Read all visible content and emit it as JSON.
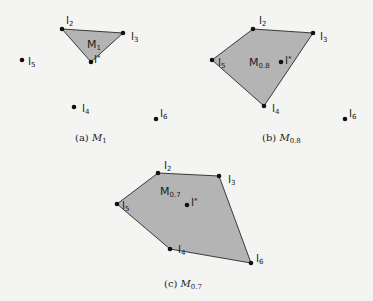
{
  "panels": [
    {
      "id": "a",
      "caption_prefix": "(a)",
      "caption_symbol": "M",
      "caption_sub": "1",
      "region_label": "M",
      "region_sub": "1",
      "polygon": [
        [
          62,
          29
        ],
        [
          123,
          33
        ],
        [
          91,
          62
        ]
      ],
      "points": [
        {
          "name": "l",
          "sub": "2",
          "x": 62,
          "y": 29,
          "lx": 66,
          "ly": 24
        },
        {
          "name": "l",
          "sub": "3",
          "x": 123,
          "y": 33,
          "lx": 131,
          "ly": 40
        },
        {
          "name": "l",
          "sub": "*",
          "x": 91,
          "y": 62,
          "lx": 94,
          "ly": 63
        },
        {
          "name": "l",
          "sub": "5",
          "x": 22,
          "y": 60,
          "lx": 28,
          "ly": 65
        },
        {
          "name": "l",
          "sub": "4",
          "x": 74,
          "y": 107,
          "lx": 82,
          "ly": 112
        },
        {
          "name": "l",
          "sub": "6",
          "x": 156,
          "y": 119,
          "lx": 160,
          "ly": 117
        }
      ],
      "region_pos": [
        87,
        48
      ],
      "caption_pos": [
        75,
        141
      ]
    },
    {
      "id": "b",
      "caption_prefix": "(b)",
      "caption_symbol": "M",
      "caption_sub": "0.8",
      "region_label": "M",
      "region_sub": "0.8",
      "polygon": [
        [
          253,
          29
        ],
        [
          313,
          33
        ],
        [
          264,
          106
        ],
        [
          212,
          60
        ]
      ],
      "points": [
        {
          "name": "l",
          "sub": "2",
          "x": 253,
          "y": 29,
          "lx": 259,
          "ly": 24
        },
        {
          "name": "l",
          "sub": "3",
          "x": 313,
          "y": 33,
          "lx": 320,
          "ly": 40
        },
        {
          "name": "l",
          "sub": "5",
          "x": 212,
          "y": 60,
          "lx": 218,
          "ly": 66
        },
        {
          "name": "l",
          "sub": "4",
          "x": 264,
          "y": 106,
          "lx": 272,
          "ly": 112
        },
        {
          "name": "l",
          "sub": "*",
          "x": 281,
          "y": 62,
          "lx": 285,
          "ly": 64
        },
        {
          "name": "l",
          "sub": "6",
          "x": 345,
          "y": 119,
          "lx": 349,
          "ly": 117
        }
      ],
      "region_pos": [
        249,
        66
      ],
      "caption_pos": [
        262,
        141
      ]
    },
    {
      "id": "c",
      "caption_prefix": "(c)",
      "caption_symbol": "M",
      "caption_sub": "0.7",
      "region_label": "M",
      "region_sub": "0.7",
      "polygon": [
        [
          158,
          173
        ],
        [
          219,
          176
        ],
        [
          251,
          263
        ],
        [
          170,
          249
        ],
        [
          117,
          204
        ]
      ],
      "points": [
        {
          "name": "l",
          "sub": "2",
          "x": 158,
          "y": 173,
          "lx": 164,
          "ly": 169
        },
        {
          "name": "l",
          "sub": "3",
          "x": 219,
          "y": 176,
          "lx": 228,
          "ly": 183
        },
        {
          "name": "l",
          "sub": "5",
          "x": 117,
          "y": 204,
          "lx": 122,
          "ly": 209
        },
        {
          "name": "l",
          "sub": "4",
          "x": 170,
          "y": 249,
          "lx": 178,
          "ly": 253
        },
        {
          "name": "l",
          "sub": "6",
          "x": 251,
          "y": 263,
          "lx": 256,
          "ly": 262
        },
        {
          "name": "l",
          "sub": "*",
          "x": 187,
          "y": 205,
          "lx": 191,
          "ly": 206
        }
      ],
      "region_pos": [
        160,
        195
      ],
      "caption_pos": [
        164,
        287
      ]
    }
  ]
}
